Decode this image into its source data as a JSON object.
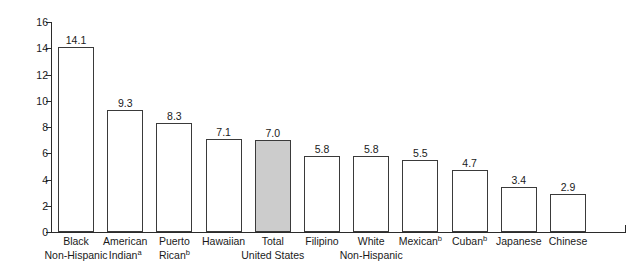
{
  "chart_data": {
    "type": "bar",
    "title": "",
    "subtitle": "",
    "xlabel": "",
    "ylabel": "Rate per 1,000 Live Births",
    "ylim": [
      0,
      16
    ],
    "yticks": [
      0,
      2,
      4,
      6,
      8,
      10,
      12,
      14,
      16
    ],
    "grid": false,
    "legend": null,
    "categories": [
      "Black Non-Hispanic",
      "American Indianᵃ",
      "Puerto Ricanᵇ",
      "Hawaiian",
      "Total United States",
      "Filipino",
      "White Non-Hispanic",
      "Mexicanᵇ",
      "Cubanᵇ",
      "Japanese",
      "Chinese"
    ],
    "values": [
      14.1,
      9.3,
      8.3,
      7.1,
      7.0,
      5.8,
      5.8,
      5.5,
      4.7,
      3.4,
      2.9
    ],
    "value_labels": [
      "14.1",
      "9.3",
      "8.3",
      "7.1",
      "7.0",
      "5.8",
      "5.8",
      "5.5",
      "4.7",
      "3.4",
      "2.9"
    ],
    "bars": [
      {
        "line1": "Black",
        "line2": "Non-Hispanic",
        "sup1": "",
        "sup2": "",
        "value": 14.1,
        "label": "14.1",
        "highlight": false
      },
      {
        "line1": "American",
        "line2": "Indian",
        "sup1": "",
        "sup2": "a",
        "value": 9.3,
        "label": "9.3",
        "highlight": false
      },
      {
        "line1": "Puerto",
        "line2": "Rican",
        "sup1": "",
        "sup2": "b",
        "value": 8.3,
        "label": "8.3",
        "highlight": false
      },
      {
        "line1": "Hawaiian",
        "line2": "",
        "sup1": "",
        "sup2": "",
        "value": 7.1,
        "label": "7.1",
        "highlight": false
      },
      {
        "line1": "Total",
        "line2": "United States",
        "sup1": "",
        "sup2": "",
        "value": 7.0,
        "label": "7.0",
        "highlight": true
      },
      {
        "line1": "Filipino",
        "line2": "",
        "sup1": "",
        "sup2": "",
        "value": 5.8,
        "label": "5.8",
        "highlight": false
      },
      {
        "line1": "White",
        "line2": "Non-Hispanic",
        "sup1": "",
        "sup2": "",
        "value": 5.8,
        "label": "5.8",
        "highlight": false
      },
      {
        "line1": "Mexican",
        "line2": "",
        "sup1": "b",
        "sup2": "",
        "value": 5.5,
        "label": "5.5",
        "highlight": false
      },
      {
        "line1": "Cuban",
        "line2": "",
        "sup1": "b",
        "sup2": "",
        "value": 4.7,
        "label": "4.7",
        "highlight": false
      },
      {
        "line1": "Japanese",
        "line2": "",
        "sup1": "",
        "sup2": "",
        "value": 3.4,
        "label": "3.4",
        "highlight": false
      },
      {
        "line1": "Chinese",
        "line2": "",
        "sup1": "",
        "sup2": "",
        "value": 2.9,
        "label": "2.9",
        "highlight": false
      }
    ],
    "colors": {
      "bar_fill": "#ffffff",
      "bar_fill_highlight": "#cccccc",
      "bar_stroke": "#3a3a3a",
      "axis": "#2b2b2b",
      "text": "#1a1a1a",
      "background": "#ffffff"
    }
  }
}
